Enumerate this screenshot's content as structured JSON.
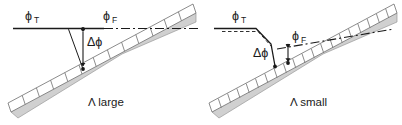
{
  "figure": {
    "width": 402,
    "height": 125,
    "background": "#ffffff",
    "ink": "#1a1a1a",
    "band_fill": "#d0d0d0",
    "band_edge": "#8c8c8c",
    "cell_stroke": "#6e6e6e"
  },
  "panels": [
    {
      "id": "left",
      "caption": "Λ large",
      "caption_lambda": "Λ",
      "caption_word": "large",
      "labels": {
        "phi_t": "ϕ",
        "phi_t_sub": "T",
        "phi_f": "ϕ",
        "phi_f_sub": "F",
        "delta_phi": "Δϕ"
      },
      "grating_period": "large",
      "cell_count": 13
    },
    {
      "id": "right",
      "caption": "Λ  small",
      "caption_lambda": "Λ",
      "caption_word": "small",
      "labels": {
        "phi_t": "ϕ",
        "phi_t_sub": "T",
        "phi_f": "ϕ",
        "phi_f_sub": "F",
        "delta_phi": "Δϕ"
      },
      "grating_period": "small",
      "cell_count": 20
    }
  ]
}
